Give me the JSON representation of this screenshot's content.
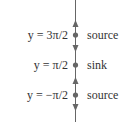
{
  "diagram": {
    "type": "phase-line",
    "colors": {
      "line": "#666666",
      "text": "#333333"
    },
    "equilibria": [
      {
        "equation": "y = 3π/2",
        "classification": "source"
      },
      {
        "equation": "y = π/2",
        "classification": "sink"
      },
      {
        "equation": "y = −π/2",
        "classification": "source"
      }
    ],
    "arrows": [
      "up",
      "down",
      "up",
      "down"
    ]
  }
}
